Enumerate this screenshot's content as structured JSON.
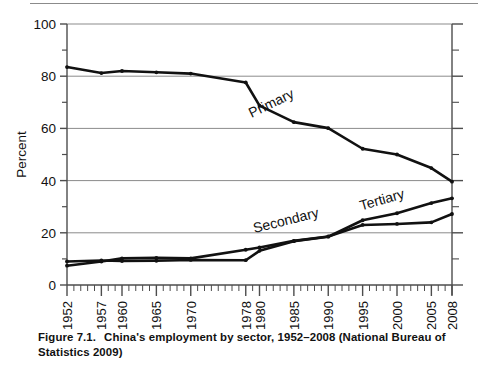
{
  "caption": {
    "figure_number": "Figure 7.1.",
    "text": "China's employment by sector, 1952–2008 (National Bureau of Statistics 2009)"
  },
  "colors": {
    "line": "#111111",
    "grid": "#8b8b8b",
    "axis": "#4d4d4d",
    "background": "#ffffff"
  },
  "chart_data": {
    "type": "line",
    "title": "",
    "subtitle": "",
    "xlabel": "",
    "ylabel": "Percent",
    "xlim": [
      1952,
      2008
    ],
    "ylim": [
      0,
      100
    ],
    "yticks": [
      0,
      20,
      40,
      60,
      80,
      100
    ],
    "ytick_labels": [
      "0",
      "20",
      "40",
      "60",
      "80",
      "100"
    ],
    "yminor_ticks": [
      10,
      30,
      50,
      70,
      90
    ],
    "xticks": [
      1952,
      1957,
      1960,
      1965,
      1970,
      1978,
      1980,
      1985,
      1990,
      1995,
      2000,
      2005,
      2008
    ],
    "xtick_labels": [
      "1952",
      "1957",
      "1960",
      "1965",
      "1970",
      "1978",
      "1980",
      "1985",
      "1990",
      "1995",
      "2000",
      "2005",
      "2008"
    ],
    "xtick_rotation": -90,
    "grid": "horizontal",
    "legend": "inline-labels",
    "series": [
      {
        "name": "Primary",
        "label": "Primary",
        "x": [
          1952,
          1957,
          1960,
          1965,
          1970,
          1978,
          1980,
          1985,
          1990,
          1995,
          2000,
          2005,
          2008
        ],
        "values": [
          83.5,
          81.2,
          82.0,
          81.5,
          81.0,
          77.6,
          68.7,
          62.4,
          60.1,
          52.2,
          50.0,
          44.8,
          39.6
        ]
      },
      {
        "name": "Secondary",
        "label": "Secondary",
        "x": [
          1952,
          1957,
          1960,
          1965,
          1970,
          1978,
          1980,
          1985,
          1990,
          1995,
          2000,
          2005,
          2008
        ],
        "values": [
          7.4,
          9.0,
          10.2,
          10.4,
          10.2,
          13.5,
          14.4,
          16.9,
          18.6,
          23.0,
          23.4,
          24.0,
          27.2
        ]
      },
      {
        "name": "Tertiary",
        "label": "Tertiary",
        "x": [
          1952,
          1957,
          1960,
          1965,
          1970,
          1978,
          1980,
          1985,
          1990,
          1995,
          2000,
          2005,
          2008
        ],
        "values": [
          9.0,
          9.4,
          9.2,
          9.3,
          9.6,
          9.5,
          13.1,
          16.8,
          18.5,
          24.8,
          27.5,
          31.4,
          33.2
        ]
      }
    ],
    "annotations": [
      {
        "text": "Primary",
        "x": 1982,
        "y": 68,
        "rotation": 26
      },
      {
        "text": "Secondary",
        "x": 1984,
        "y": 23,
        "rotation": 14
      },
      {
        "text": "Tertiary",
        "x": 1998,
        "y": 31,
        "rotation": 16
      }
    ]
  }
}
